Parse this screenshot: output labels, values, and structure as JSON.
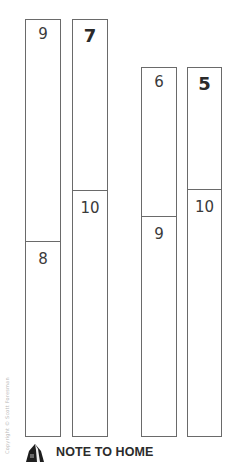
{
  "bars": [
    {
      "top_label": "9",
      "bottom_label": "8",
      "top_style": "light"
    },
    {
      "top_label": "7",
      "bottom_label": "10",
      "top_style": "bold"
    },
    {
      "top_label": "6",
      "bottom_label": "9",
      "top_style": "light"
    },
    {
      "top_label": "5",
      "bottom_label": "10",
      "top_style": "bold"
    }
  ],
  "copyright": "Copyright © Scott Foresman",
  "footer": {
    "icon": "house-icon",
    "title": "NOTE TO HOME"
  },
  "colors": {
    "line": "#6a6a6a",
    "text": "#3a3a3a",
    "background": "#ffffff"
  }
}
